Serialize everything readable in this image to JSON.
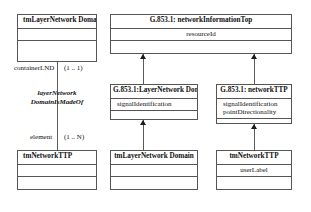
{
  "diagram": {
    "type": "uml-class-diagram",
    "classes": {
      "tm_lnd_top": {
        "name": "tmLayerNetwork Domain",
        "attributes": [],
        "compartments": 3
      },
      "g853_nit": {
        "name": "G.853.1:  networkInformationTop",
        "attributes": [
          "resourceId"
        ],
        "compartments": 3
      },
      "g853_lnd": {
        "name": "G.853.1:LayerNetwork Domain",
        "attributes": [
          "signalIdentification"
        ],
        "compartments": 3
      },
      "g853_nttp": {
        "name": "G.853.1:  networkTTP",
        "attributes": [
          "signalIdentification",
          "pointDirectionality"
        ],
        "compartments": 3
      },
      "tm_nttp_left": {
        "name": "tmNetworkTTP",
        "attributes": [],
        "compartments": 3
      },
      "tm_lnd_bottom": {
        "name": "tmLayerNetwork Domain",
        "attributes": [],
        "compartments": 3
      },
      "tm_nttp_right": {
        "name": "tmNetworkTTP",
        "attributes": [
          "userLabel"
        ],
        "compartments": 3
      }
    },
    "association": {
      "source_role": "containerLND",
      "source_multiplicity": "(1 .. 1)",
      "name_line1": "layerNetwork",
      "name_line2": "DomainIsMadeOf",
      "target_role": "element",
      "target_multiplicity": "(1 .. N)"
    },
    "colors": {
      "background": "#ffffff",
      "border": "#555555",
      "text": "#101010",
      "arrow": "#1a1a1a"
    }
  }
}
